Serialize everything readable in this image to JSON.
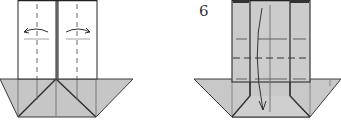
{
  "diagram": {
    "type": "origami-instructions",
    "steps": [
      {
        "id": "step-5",
        "number_label": "",
        "instruction": "valley fold both flaps outward along dashed lines",
        "arrows": [
          "fold-left",
          "fold-right"
        ]
      },
      {
        "id": "step-6",
        "number_label": "6",
        "instruction": "fold top section down along center",
        "arrows": [
          "fold-down"
        ]
      }
    ],
    "colors": {
      "paper_white": "#ffffff",
      "paper_gray": "#c8c8c8",
      "paper_gray_light": "#d2d2d2",
      "line": "#3a3a3a",
      "crease": "#555555"
    }
  }
}
